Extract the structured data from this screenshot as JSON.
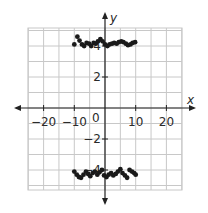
{
  "chart_data": {
    "type": "scatter",
    "title": "",
    "xlabel": "x",
    "ylabel": "y",
    "xlim": [
      -25,
      25
    ],
    "ylim": [
      -5.2,
      5.2
    ],
    "grid": true,
    "grid_x_step": 5,
    "grid_y_step": 1,
    "x_ticks": [
      -20,
      -10,
      10,
      20
    ],
    "x_tick_labels": [
      "−20",
      "−10",
      "10",
      "20"
    ],
    "y_ticks": [
      -4,
      -2,
      2,
      4
    ],
    "y_tick_labels": [
      "−4",
      "−2",
      "2",
      "4"
    ],
    "origin_label": "0",
    "series": [
      {
        "name": "upper",
        "points": [
          [
            -10,
            4.1
          ],
          [
            -9,
            4.6
          ],
          [
            -8.3,
            4.35
          ],
          [
            -7.5,
            4.1
          ],
          [
            -6.8,
            4.0
          ],
          [
            -6,
            4.2
          ],
          [
            -5.2,
            4.15
          ],
          [
            -4.5,
            4.0
          ],
          [
            -3.7,
            4.2
          ],
          [
            -3,
            4.15
          ],
          [
            -2.3,
            4.3
          ],
          [
            -1.5,
            4.45
          ],
          [
            -0.8,
            4.3
          ],
          [
            0,
            4.1
          ],
          [
            0.8,
            4.0
          ],
          [
            1.5,
            4.1
          ],
          [
            2.3,
            4.15
          ],
          [
            3,
            4.2
          ],
          [
            3.8,
            4.15
          ],
          [
            4.5,
            4.25
          ],
          [
            5.3,
            4.3
          ],
          [
            6,
            4.25
          ],
          [
            6.8,
            4.15
          ],
          [
            7.5,
            4.05
          ],
          [
            8.3,
            4.1
          ],
          [
            9,
            4.2
          ],
          [
            9.8,
            4.25
          ]
        ]
      },
      {
        "name": "lower",
        "points": [
          [
            -10,
            -4.1
          ],
          [
            -9.2,
            -4.3
          ],
          [
            -8.5,
            -4.45
          ],
          [
            -7.8,
            -4.5
          ],
          [
            -7,
            -4.3
          ],
          [
            -6.2,
            -4.1
          ],
          [
            -5.5,
            -4.25
          ],
          [
            -4.8,
            -4.4
          ],
          [
            -4,
            -4.2
          ],
          [
            -3.3,
            -4.1
          ],
          [
            -2.5,
            -4.3
          ],
          [
            -1.8,
            -4.15
          ],
          [
            -1,
            -4.0
          ],
          [
            -0.3,
            -4.35
          ],
          [
            0.5,
            -4.45
          ],
          [
            1.2,
            -4.3
          ],
          [
            2,
            -4.2
          ],
          [
            2.7,
            -4.35
          ],
          [
            3.5,
            -4.25
          ],
          [
            4.2,
            -4.1
          ],
          [
            5,
            -3.95
          ],
          [
            5.7,
            -4.2
          ],
          [
            6.5,
            -4.35
          ],
          [
            7.2,
            -4.5
          ],
          [
            8,
            -4.0
          ],
          [
            8.8,
            -4.1
          ],
          [
            9.5,
            -4.2
          ],
          [
            10,
            -4.3
          ]
        ]
      }
    ]
  }
}
